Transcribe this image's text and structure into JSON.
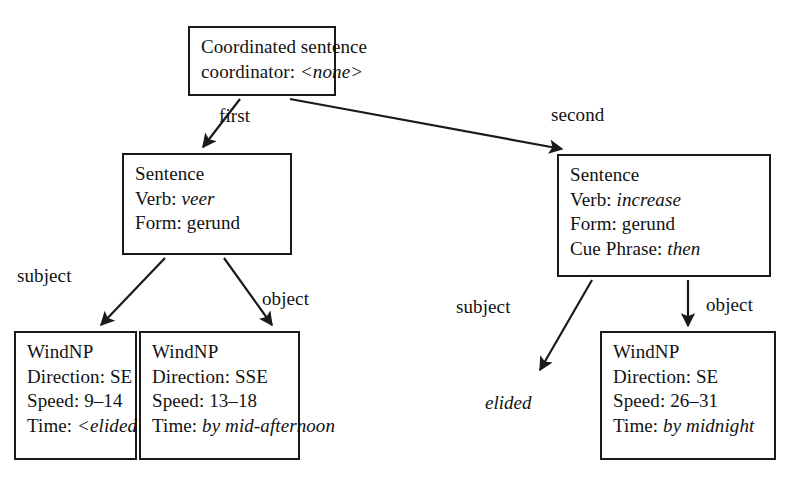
{
  "diagram": {
    "background_color": "#ffffff",
    "line_color": "#1a1a1a"
  },
  "nodes": {
    "root": {
      "name": "coordinated-sentence",
      "lines": [
        {
          "label": "Coordinated sentence",
          "value": "",
          "value_italic": false
        },
        {
          "label": "coordinator:",
          "value": "<none>",
          "value_italic": true
        }
      ]
    },
    "sentence_first": {
      "name": "sentence-first",
      "lines": [
        {
          "label": "Sentence",
          "value": "",
          "value_italic": false
        },
        {
          "label": "Verb:",
          "value": "veer",
          "value_italic": true
        },
        {
          "label": "Form:",
          "value": "gerund",
          "value_italic": false
        }
      ]
    },
    "sentence_second": {
      "name": "sentence-second",
      "lines": [
        {
          "label": "Sentence",
          "value": "",
          "value_italic": false
        },
        {
          "label": "Verb:",
          "value": "increase",
          "value_italic": true
        },
        {
          "label": "Form:",
          "value": "gerund",
          "value_italic": false
        },
        {
          "label": "Cue Phrase:",
          "value": "then",
          "value_italic": true
        }
      ]
    },
    "windnp_subject_first": {
      "name": "windnp-subject-first",
      "lines": [
        {
          "label": "WindNP",
          "value": "",
          "value_italic": false
        },
        {
          "label": "Direction:",
          "value": "SE",
          "value_italic": false
        },
        {
          "label": "Speed:",
          "value": "9–14",
          "value_italic": false
        },
        {
          "label": "Time:",
          "value": "<elided>",
          "value_italic": true
        }
      ]
    },
    "windnp_object_first": {
      "name": "windnp-object-first",
      "lines": [
        {
          "label": "WindNP",
          "value": "",
          "value_italic": false
        },
        {
          "label": "Direction:",
          "value": "SSE",
          "value_italic": false
        },
        {
          "label": "Speed:",
          "value": "13–18",
          "value_italic": false
        },
        {
          "label": "Time:",
          "value": "by mid-afternoon",
          "value_italic": true
        }
      ]
    },
    "windnp_object_second": {
      "name": "windnp-object-second",
      "lines": [
        {
          "label": "WindNP",
          "value": "",
          "value_italic": false
        },
        {
          "label": "Direction:",
          "value": "SE",
          "value_italic": false
        },
        {
          "label": "Speed:",
          "value": "26–31",
          "value_italic": false
        },
        {
          "label": "Time:",
          "value": "by midnight",
          "value_italic": true
        }
      ]
    }
  },
  "free_text": {
    "elided": "elided"
  },
  "edges": [
    {
      "name": "edge-first",
      "label": "first",
      "from": "root",
      "to": "sentence_first"
    },
    {
      "name": "edge-second",
      "label": "second",
      "from": "root",
      "to": "sentence_second"
    },
    {
      "name": "edge-subject-1",
      "label": "subject",
      "from": "sentence_first",
      "to": "windnp_subject_first"
    },
    {
      "name": "edge-object-1",
      "label": "object",
      "from": "sentence_first",
      "to": "windnp_object_first"
    },
    {
      "name": "edge-subject-2",
      "label": "subject",
      "from": "sentence_second",
      "to": "elided"
    },
    {
      "name": "edge-object-2",
      "label": "object",
      "from": "sentence_second",
      "to": "windnp_object_second"
    }
  ],
  "edge_labels": {
    "first": "first",
    "second": "second",
    "subject_1": "subject",
    "object_1": "object",
    "subject_2": "subject",
    "object_2": "object"
  }
}
